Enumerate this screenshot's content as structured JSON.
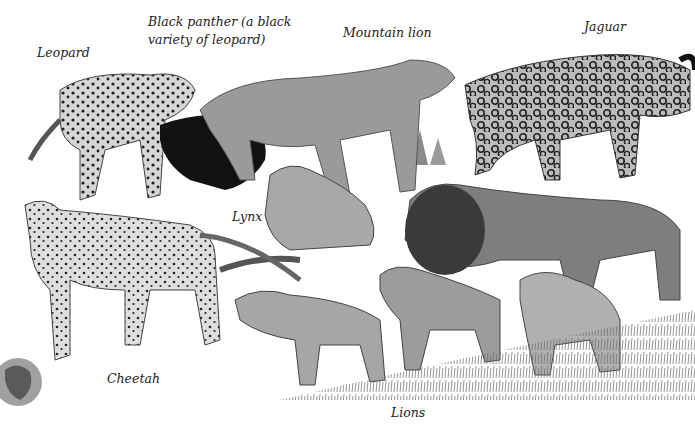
{
  "illustration": {
    "subject": "Big cats of the world",
    "labels": {
      "leopard": "Leopard",
      "black_panther_line1": "Black panther (a black",
      "black_panther_line2": "variety of leopard)",
      "mountain_lion": "Mountain lion",
      "jaguar": "Jaguar",
      "lynx": "Lynx",
      "cheetah": "Cheetah",
      "lions": "Lions"
    },
    "palette": {
      "background": "#ffffff",
      "label_text": "#222222",
      "fur_light": "#bdbdbd",
      "fur_mid": "#8a8a8a",
      "fur_dark": "#3a3a3a",
      "black_panther": "#111111",
      "spots": "#1e1e1e",
      "grass": "#6b6b6b"
    }
  }
}
